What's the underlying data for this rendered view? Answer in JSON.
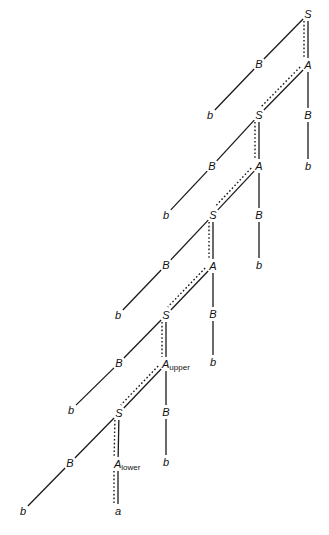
{
  "diagram": {
    "type": "parse-tree",
    "nodes": [
      {
        "id": "S1",
        "label": "S",
        "sub": "",
        "x": 308,
        "y": 14
      },
      {
        "id": "B1",
        "label": "B",
        "sub": "",
        "x": 259,
        "y": 64
      },
      {
        "id": "A1",
        "label": "A",
        "sub": "",
        "x": 308,
        "y": 65
      },
      {
        "id": "b1",
        "label": "b",
        "sub": "",
        "x": 210,
        "y": 115
      },
      {
        "id": "S2",
        "label": "S",
        "sub": "",
        "x": 259,
        "y": 115
      },
      {
        "id": "B1r",
        "label": "B",
        "sub": "",
        "x": 308,
        "y": 115
      },
      {
        "id": "b1r",
        "label": "b",
        "sub": "",
        "x": 308,
        "y": 166
      },
      {
        "id": "B2",
        "label": "B",
        "sub": "",
        "x": 212,
        "y": 166
      },
      {
        "id": "A2",
        "label": "A",
        "sub": "",
        "x": 259,
        "y": 166
      },
      {
        "id": "b2",
        "label": "b",
        "sub": "",
        "x": 166,
        "y": 215
      },
      {
        "id": "S3",
        "label": "S",
        "sub": "",
        "x": 213,
        "y": 215
      },
      {
        "id": "B2r",
        "label": "B",
        "sub": "",
        "x": 259,
        "y": 215
      },
      {
        "id": "b2r",
        "label": "b",
        "sub": "",
        "x": 259,
        "y": 265
      },
      {
        "id": "B3",
        "label": "B",
        "sub": "",
        "x": 166,
        "y": 265
      },
      {
        "id": "A3",
        "label": "A",
        "sub": "",
        "x": 213,
        "y": 266
      },
      {
        "id": "b3",
        "label": "b",
        "sub": "",
        "x": 118,
        "y": 315
      },
      {
        "id": "S4",
        "label": "S",
        "sub": "",
        "x": 166,
        "y": 315
      },
      {
        "id": "B3r",
        "label": "B",
        "sub": "",
        "x": 213,
        "y": 314
      },
      {
        "id": "b3r",
        "label": "b",
        "sub": "",
        "x": 213,
        "y": 362
      },
      {
        "id": "B4",
        "label": "B",
        "sub": "",
        "x": 119,
        "y": 363
      },
      {
        "id": "A4",
        "label": "A",
        "sub": "upper",
        "x": 166,
        "y": 364
      },
      {
        "id": "b4",
        "label": "b",
        "sub": "",
        "x": 71,
        "y": 410
      },
      {
        "id": "S5",
        "label": "S",
        "sub": "",
        "x": 119,
        "y": 413
      },
      {
        "id": "B4r",
        "label": "B",
        "sub": "",
        "x": 166,
        "y": 412
      },
      {
        "id": "b4r",
        "label": "b",
        "sub": "",
        "x": 166,
        "y": 462
      },
      {
        "id": "B5",
        "label": "B",
        "sub": "",
        "x": 70,
        "y": 463
      },
      {
        "id": "A5",
        "label": "A",
        "sub": "lower",
        "x": 118,
        "y": 464
      },
      {
        "id": "b5",
        "label": "b",
        "sub": "",
        "x": 23,
        "y": 511
      },
      {
        "id": "a5",
        "label": "a",
        "sub": "",
        "x": 118,
        "y": 511
      }
    ],
    "edges": [
      [
        "S1",
        "B1"
      ],
      [
        "S1",
        "A1"
      ],
      [
        "B1",
        "b1"
      ],
      [
        "A1",
        "S2"
      ],
      [
        "A1",
        "B1r"
      ],
      [
        "B1r",
        "b1r"
      ],
      [
        "S2",
        "B2"
      ],
      [
        "S2",
        "A2"
      ],
      [
        "B2",
        "b2"
      ],
      [
        "A2",
        "S3"
      ],
      [
        "A2",
        "B2r"
      ],
      [
        "B2r",
        "b2r"
      ],
      [
        "S3",
        "B3"
      ],
      [
        "S3",
        "A3"
      ],
      [
        "B3",
        "b3"
      ],
      [
        "A3",
        "S4"
      ],
      [
        "A3",
        "B3r"
      ],
      [
        "B3r",
        "b3r"
      ],
      [
        "S4",
        "B4"
      ],
      [
        "S4",
        "A4"
      ],
      [
        "B4",
        "b4"
      ],
      [
        "A4",
        "S5"
      ],
      [
        "A4",
        "B4r"
      ],
      [
        "B4r",
        "b4r"
      ],
      [
        "S5",
        "B5"
      ],
      [
        "S5",
        "A5"
      ],
      [
        "B5",
        "b5"
      ],
      [
        "A5",
        "a5"
      ]
    ],
    "highlighted_path": [
      "S1",
      "A1",
      "S2",
      "A2",
      "S3",
      "A3",
      "S4",
      "A4",
      "S5",
      "A5",
      "a5"
    ]
  },
  "caption": ""
}
